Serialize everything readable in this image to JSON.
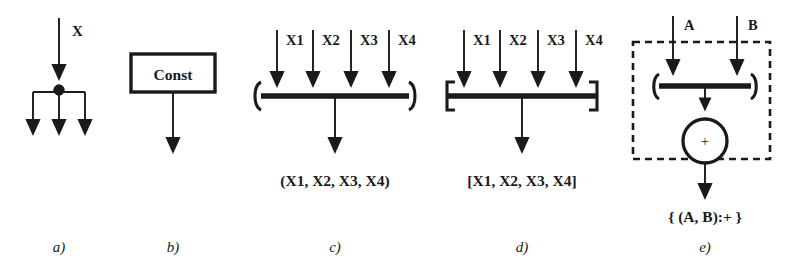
{
  "figure": {
    "background": "#ffffff",
    "ink": "#1a1a1a",
    "panels": [
      {
        "id": "a",
        "caption": "a)",
        "kind": "fan-out-distributor",
        "input_label": "X",
        "output_count": 3
      },
      {
        "id": "b",
        "caption": "b)",
        "kind": "constant-node",
        "box_label": "Const",
        "output_count": 1
      },
      {
        "id": "c",
        "caption": "c)",
        "kind": "tuple-constructor",
        "bracket_open": "(",
        "bracket_close": ")",
        "inputs": [
          "X1",
          "X2",
          "X3",
          "X4"
        ],
        "output_label": "(X1, X2, X3, X4)"
      },
      {
        "id": "d",
        "caption": "d)",
        "kind": "list-constructor",
        "bracket_open": "[",
        "bracket_close": "]",
        "inputs": [
          "X1",
          "X2",
          "X3",
          "X4"
        ],
        "output_label": "[X1, X2, X3, X4]"
      },
      {
        "id": "e",
        "caption": "e)",
        "kind": "composite-operation",
        "bracket_open": "(",
        "bracket_close": ")",
        "inputs": [
          "A",
          "B"
        ],
        "operator_glyph": "+",
        "output_label": "{ (A, B):+ }"
      }
    ]
  }
}
